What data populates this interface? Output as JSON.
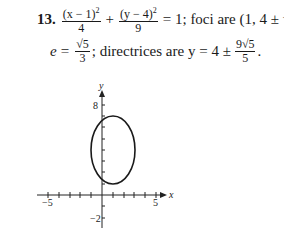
{
  "problem": {
    "number": "13.",
    "eq_frac1_num": "(x − 1)",
    "eq_frac1_exp": "2",
    "eq_frac1_den": "4",
    "plus": "+",
    "eq_frac2_num": "(y − 4)",
    "eq_frac2_exp": "2",
    "eq_frac2_den": "9",
    "eq_rhs": "= 1; foci are (1, 4 ± √5);",
    "e_label": "e",
    "e_eq": "=",
    "e_num": "√5",
    "e_den": "3",
    "directrices_text": "; directrices are y = 4 ±",
    "dir_num": "9√5",
    "dir_den": "5",
    "period": "."
  },
  "graph": {
    "x_axis_label": "x",
    "y_axis_label": "y",
    "x_tick_labels": [
      "−5",
      "5"
    ],
    "y_tick_labels": [
      "8",
      "−2"
    ],
    "ellipse": {
      "center": [
        1,
        4
      ],
      "a_x": 2,
      "b_y": 3
    }
  }
}
